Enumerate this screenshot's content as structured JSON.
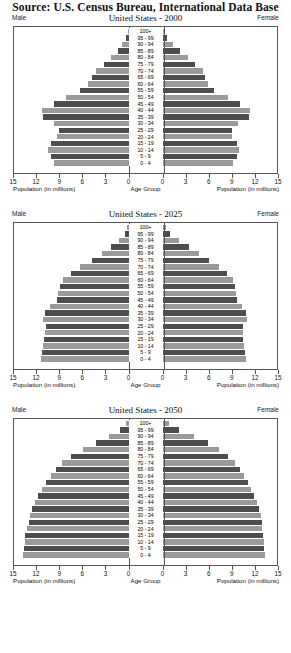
{
  "source": "Source: U.S. Census Bureau, International Data Base",
  "labels": {
    "male": "Male",
    "female": "Female",
    "population_axis": "Population (in millions)",
    "age_axis": "Age Group"
  },
  "axis": {
    "left_ticks": [
      "15",
      "12",
      "9",
      "6",
      "3",
      "0"
    ],
    "right_ticks": [
      "0",
      "3",
      "6",
      "9",
      "12",
      "15"
    ],
    "max": 15
  },
  "age_groups": [
    "100+",
    "95 - 99",
    "90 - 94",
    "85 - 89",
    "80 - 84",
    "75 - 79",
    "70 - 74",
    "65 - 69",
    "60 - 64",
    "55 - 59",
    "50 - 54",
    "45 - 49",
    "40 - 44",
    "35 - 39",
    "30 - 34",
    "25 - 29",
    "20 - 24",
    "15 - 19",
    "10 - 14",
    "5 - 9",
    "0 - 4"
  ],
  "chart_data": [
    {
      "type": "bar",
      "title": "United States - 2000",
      "xlabel": "Population (in millions)",
      "ylabel": "Age Group",
      "xlim": [
        0,
        15
      ],
      "grid": false,
      "categories": [
        "100+",
        "95 - 99",
        "90 - 94",
        "85 - 89",
        "80 - 84",
        "75 - 79",
        "70 - 74",
        "65 - 69",
        "60 - 64",
        "55 - 59",
        "50 - 54",
        "45 - 49",
        "40 - 44",
        "35 - 39",
        "30 - 34",
        "25 - 29",
        "20 - 24",
        "15 - 19",
        "10 - 14",
        "5 - 9",
        "0 - 4"
      ],
      "series": [
        {
          "name": "Male",
          "values": [
            0.1,
            0.3,
            0.8,
            1.4,
            2.3,
            3.2,
            4.3,
            4.8,
            5.3,
            6.3,
            8.2,
            9.8,
            11.3,
            11.2,
            9.8,
            9.1,
            9.4,
            10.2,
            10.5,
            10.2,
            9.7
          ]
        },
        {
          "name": "Female",
          "values": [
            0.2,
            0.6,
            1.4,
            2.3,
            3.4,
            4.3,
            5.3,
            5.6,
            5.9,
            6.8,
            8.6,
            10.1,
            11.4,
            11.3,
            9.9,
            9.1,
            9.1,
            9.7,
            10.0,
            9.7,
            9.3
          ]
        }
      ]
    },
    {
      "type": "bar",
      "title": "United States - 2025",
      "xlabel": "Population (in millions)",
      "ylabel": "Age Group",
      "xlim": [
        0,
        15
      ],
      "grid": false,
      "categories": [
        "100+",
        "95 - 99",
        "90 - 94",
        "85 - 89",
        "80 - 84",
        "75 - 79",
        "70 - 74",
        "65 - 69",
        "60 - 64",
        "55 - 59",
        "50 - 54",
        "45 - 49",
        "40 - 44",
        "35 - 39",
        "30 - 34",
        "25 - 29",
        "20 - 24",
        "15 - 19",
        "10 - 14",
        "5 - 9",
        "0 - 4"
      ],
      "series": [
        {
          "name": "Male",
          "values": [
            0.2,
            0.5,
            1.2,
            2.3,
            3.5,
            4.8,
            6.4,
            7.6,
            8.6,
            9.0,
            9.2,
            9.4,
            10.3,
            11.0,
            11.2,
            10.8,
            10.9,
            11.1,
            11.2,
            11.3,
            11.4
          ]
        },
        {
          "name": "Female",
          "values": [
            0.4,
            1.0,
            2.2,
            3.5,
            4.8,
            6.1,
            7.4,
            8.4,
            9.2,
            9.5,
            9.6,
            9.7,
            10.4,
            11.0,
            11.1,
            10.6,
            10.5,
            10.6,
            10.7,
            10.8,
            10.9
          ]
        }
      ]
    },
    {
      "type": "bar",
      "title": "United States - 2050",
      "xlabel": "Population (in millions)",
      "ylabel": "Age Group",
      "xlim": [
        0,
        15
      ],
      "grid": false,
      "categories": [
        "100+",
        "95 - 99",
        "90 - 94",
        "85 - 89",
        "80 - 84",
        "75 - 79",
        "70 - 74",
        "65 - 69",
        "60 - 64",
        "55 - 59",
        "50 - 54",
        "45 - 49",
        "40 - 44",
        "35 - 39",
        "30 - 34",
        "25 - 29",
        "20 - 24",
        "15 - 19",
        "10 - 14",
        "5 - 9",
        "0 - 4"
      ],
      "series": [
        {
          "name": "Male",
          "values": [
            0.3,
            1.1,
            2.6,
            4.3,
            6.0,
            7.5,
            8.7,
            9.5,
            10.2,
            10.8,
            11.3,
            11.8,
            12.2,
            12.6,
            12.9,
            13.1,
            13.3,
            13.5,
            13.6,
            13.7,
            13.8
          ]
        },
        {
          "name": "Female",
          "values": [
            0.9,
            2.1,
            4.1,
            5.9,
            7.4,
            8.6,
            9.5,
            10.1,
            10.7,
            11.2,
            11.6,
            12.0,
            12.4,
            12.7,
            12.9,
            13.0,
            13.1,
            13.2,
            13.3,
            13.3,
            13.4
          ]
        }
      ]
    }
  ]
}
